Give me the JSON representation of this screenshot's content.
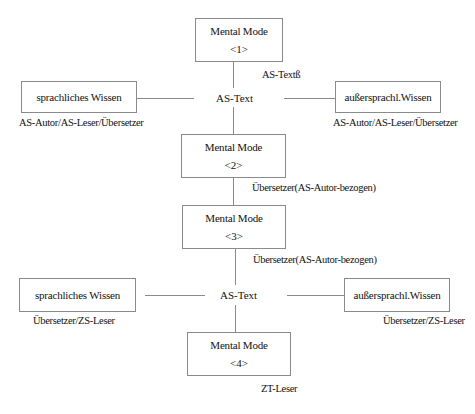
{
  "diagram": {
    "top_section": {
      "mental_mode_1": {
        "title": "Mental Mode",
        "number": "<1>",
        "annotation": "AS-Textß"
      },
      "center_node": "AS-Text",
      "left_box": {
        "label": "sprachliches Wissen",
        "caption": "AS-Autor/AS-Leser/Übersetzer"
      },
      "right_box": {
        "label": "außersprachl.Wissen",
        "caption": "AS-Autor/AS-Leser/Übersetzer"
      }
    },
    "mental_mode_2": {
      "title": "Mental Mode",
      "number": "<2>",
      "annotation": "Übersetzer(AS-Autor-bezogen)"
    },
    "mental_mode_3": {
      "title": "Mental Mode",
      "number": "<3>",
      "annotation": "Übersetzer(AS-Autor-bezogen)"
    },
    "bottom_section": {
      "center_node": "AS-Text",
      "left_box": {
        "label": "sprachliches Wissen",
        "caption": "Übersetzer/ZS-Leser"
      },
      "right_box": {
        "label": "außersprachl.Wissen",
        "caption": "Übersetzer/ZS-Leser"
      },
      "mental_mode_4": {
        "title": "Mental Mode",
        "number": "<4>",
        "annotation": "ZT-Leser"
      }
    },
    "colors": {
      "line": "#8a8a8a",
      "text": "#111111",
      "background": "#ffffff"
    }
  }
}
